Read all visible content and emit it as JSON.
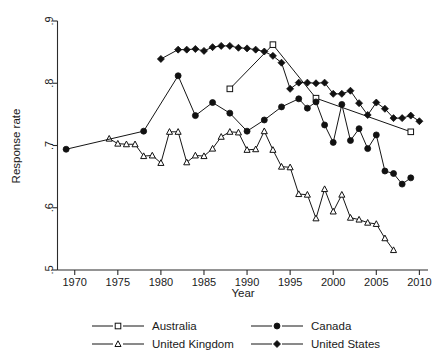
{
  "chart_data": {
    "type": "line",
    "title": "",
    "xlabel": "Year",
    "ylabel": "Response rate",
    "xlim": [
      1968,
      2011
    ],
    "ylim": [
      0.5,
      0.9
    ],
    "xticks": [
      1970,
      1975,
      1980,
      1985,
      1990,
      1995,
      2000,
      2005,
      2010
    ],
    "xtick_labels": [
      "1970",
      "1975",
      "1980",
      "1985",
      "1990",
      "1995",
      "2000",
      "2005",
      "2010"
    ],
    "yticks": [
      0.5,
      0.6,
      0.7,
      0.8,
      0.9
    ],
    "ytick_labels": [
      ".5",
      ".6",
      ".7",
      ".8",
      ".9"
    ],
    "grid": false,
    "legend_position": "bottom",
    "series": [
      {
        "name": "Australia",
        "marker": "open-square",
        "color": "#111111",
        "x": [
          1988,
          1993,
          1998,
          2009
        ],
        "values": [
          0.791,
          0.862,
          0.776,
          0.722
        ]
      },
      {
        "name": "United Kingdom",
        "marker": "open-triangle",
        "color": "#111111",
        "x": [
          1974,
          1975,
          1976,
          1977,
          1978,
          1979,
          1980,
          1981,
          1982,
          1983,
          1984,
          1985,
          1986,
          1987,
          1988,
          1989,
          1990,
          1991,
          1992,
          1993,
          1994,
          1995,
          1996,
          1997,
          1998,
          1999,
          2000,
          2001,
          2002,
          2003,
          2004,
          2005,
          2006,
          2007
        ],
        "values": [
          0.711,
          0.703,
          0.702,
          0.702,
          0.683,
          0.684,
          0.672,
          0.722,
          0.722,
          0.673,
          0.684,
          0.683,
          0.695,
          0.714,
          0.722,
          0.721,
          0.693,
          0.694,
          0.723,
          0.693,
          0.666,
          0.665,
          0.622,
          0.621,
          0.583,
          0.63,
          0.594,
          0.621,
          0.584,
          0.581,
          0.576,
          0.574,
          0.551,
          0.532
        ]
      },
      {
        "name": "Canada",
        "marker": "filled-circle",
        "color": "#111111",
        "x": [
          1969,
          1978,
          1982,
          1984,
          1986,
          1988,
          1990,
          1992,
          1994,
          1996,
          1997,
          1998,
          1999,
          2000,
          2001,
          2002,
          2003,
          2004,
          2005,
          2006,
          2007,
          2008,
          2009
        ],
        "values": [
          0.694,
          0.723,
          0.812,
          0.748,
          0.769,
          0.752,
          0.723,
          0.741,
          0.762,
          0.775,
          0.76,
          0.77,
          0.733,
          0.705,
          0.766,
          0.708,
          0.727,
          0.695,
          0.717,
          0.659,
          0.655,
          0.638,
          0.648
        ]
      },
      {
        "name": "United States",
        "marker": "filled-diamond",
        "color": "#111111",
        "x": [
          1980,
          1982,
          1983,
          1984,
          1985,
          1986,
          1987,
          1988,
          1989,
          1990,
          1991,
          1992,
          1993,
          1994,
          1995,
          1996,
          1997,
          1998,
          1999,
          2000,
          2001,
          2002,
          2003,
          2004,
          2005,
          2006,
          2007,
          2008,
          2009,
          2010
        ],
        "values": [
          0.839,
          0.854,
          0.854,
          0.855,
          0.852,
          0.858,
          0.86,
          0.86,
          0.857,
          0.856,
          0.854,
          0.851,
          0.844,
          0.833,
          0.791,
          0.801,
          0.801,
          0.8,
          0.801,
          0.783,
          0.783,
          0.788,
          0.768,
          0.749,
          0.769,
          0.759,
          0.744,
          0.744,
          0.748,
          0.739
        ]
      }
    ]
  },
  "legend": {
    "entries": [
      {
        "label": "Australia",
        "marker": "open-square"
      },
      {
        "label": "Canada",
        "marker": "filled-circle"
      },
      {
        "label": "United Kingdom",
        "marker": "open-triangle"
      },
      {
        "label": "United States",
        "marker": "filled-diamond"
      }
    ]
  },
  "axes": {
    "x_title": "Year",
    "y_title": "Response rate"
  }
}
